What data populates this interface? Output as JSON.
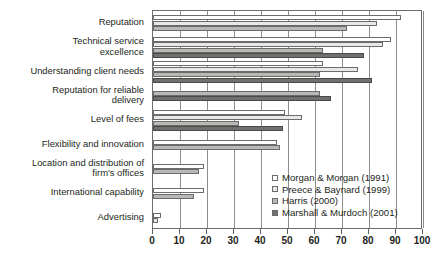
{
  "chart_data": {
    "type": "bar",
    "orientation": "horizontal",
    "title": "",
    "xlabel": "",
    "ylabel": "",
    "xlim": [
      0,
      100
    ],
    "xticks": [
      0,
      10,
      20,
      30,
      40,
      50,
      60,
      70,
      80,
      90,
      100
    ],
    "xtick_labels": [
      "0",
      "10",
      "20",
      "30",
      "40",
      "50",
      "60",
      "70",
      "80",
      "90",
      "100"
    ],
    "grid": true,
    "legend_position": "inside-bottom-right",
    "categories": [
      "Reputation",
      "Technical service\nexcellence",
      "Understanding client needs",
      "Reputation for reliable\ndelivery",
      "Level of fees",
      "Flexibility and innovation",
      "Location and distribution of\nfirm's offices",
      "International capability",
      "Advertising"
    ],
    "series": [
      {
        "name": "Morgan & Morgan (1991)",
        "color": "#ffffff",
        "values": [
          92,
          88,
          63,
          null,
          49,
          46,
          19,
          19,
          3
        ]
      },
      {
        "name": "Preece & Baynard (1999)",
        "color": "#e8e8e6",
        "values": [
          83,
          85,
          76,
          null,
          55,
          null,
          null,
          null,
          2
        ]
      },
      {
        "name": "Harris (2000)",
        "color": "#b8b8b4",
        "values": [
          72,
          63,
          62,
          62,
          32,
          47,
          17,
          15,
          null
        ]
      },
      {
        "name": "Marshall & Murdoch (2001)",
        "color": "#6f6f6d",
        "values": [
          null,
          78,
          81,
          66,
          48,
          null,
          null,
          null,
          null
        ]
      }
    ]
  },
  "legend": {
    "items": [
      {
        "label": "Morgan & Morgan (1991)"
      },
      {
        "label": "Preece & Baynard (1999)"
      },
      {
        "label": "Harris (2000)"
      },
      {
        "label": "Marshall & Murdoch (2001)"
      }
    ]
  }
}
